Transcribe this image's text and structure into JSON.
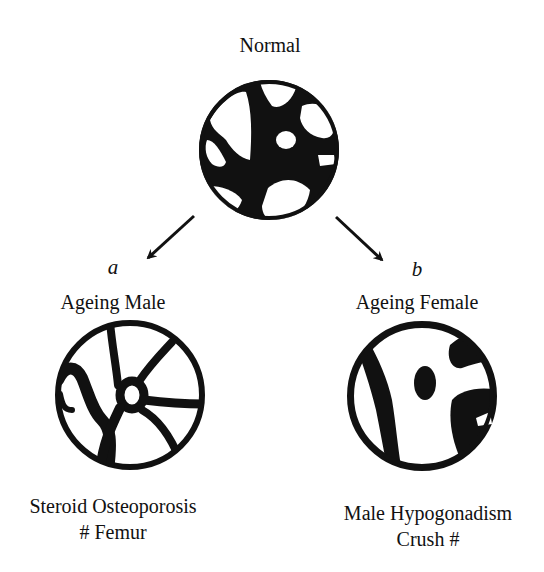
{
  "diagram": {
    "top": {
      "title": "Normal"
    },
    "branches": [
      {
        "letter": "a",
        "title": "Ageing Male",
        "caption_line1": "Steroid Osteoporosis",
        "caption_line2": "# Femur"
      },
      {
        "letter": "b",
        "title": "Ageing Female",
        "caption_line1": "Male Hypogonadism",
        "caption_line2": "Crush #"
      }
    ]
  },
  "colors": {
    "ink": "#111111",
    "background": "#ffffff"
  }
}
